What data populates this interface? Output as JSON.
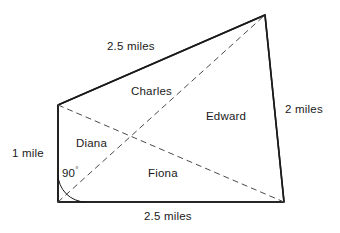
{
  "figure": {
    "type": "geometry-diagram",
    "shape": "quadrilateral",
    "background_color": "#ffffff",
    "line_color": "#1a1a1a",
    "text_color": "#1a1a1a"
  },
  "dimensions": {
    "top_side": "2.5 miles",
    "left_side": "1 mile",
    "right_side": "2 miles",
    "bottom_side": "2.5 miles"
  },
  "angle": {
    "value": "90",
    "degree_symbol": "°",
    "location": "bottom-left-vertex"
  },
  "regions": {
    "charles": "Charles",
    "edward": "Edward",
    "diana": "Diana",
    "fiona": "Fiona"
  },
  "geometry": {
    "vertices": {
      "top_left": [
        58,
        105
      ],
      "top_right": [
        265,
        15
      ],
      "bottom_right": [
        284,
        202
      ],
      "bottom_left": [
        58,
        202
      ]
    },
    "diagonals": [
      {
        "name": "top-left-to-bottom-right",
        "from": [
          58,
          105
        ],
        "to": [
          284,
          202
        ],
        "style": "dashed"
      },
      {
        "name": "bottom-left-to-top-right",
        "from": [
          58,
          202
        ],
        "to": [
          265,
          15
        ],
        "style": "dashed"
      }
    ],
    "diagonal_intersection": [
      162,
      133
    ],
    "angle_arc": {
      "center": [
        58,
        202
      ],
      "radius": 28
    }
  }
}
